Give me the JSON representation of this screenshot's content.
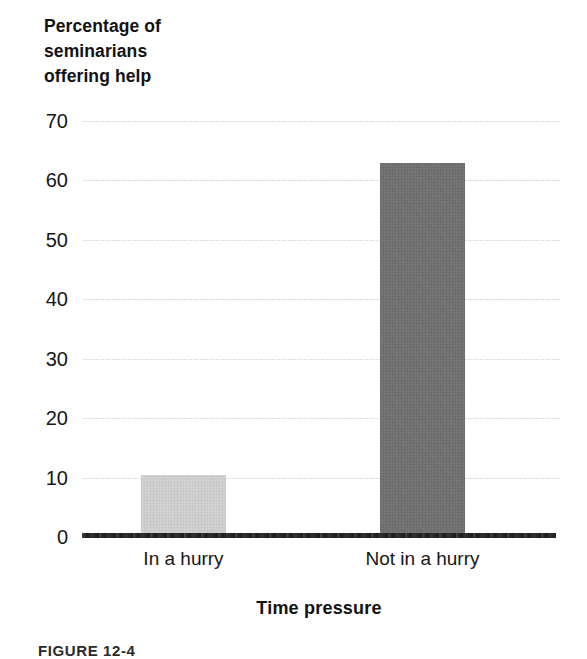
{
  "figure": {
    "caption": "FIGURE 12-4",
    "y_axis_title_lines": [
      "Percentage of",
      "seminarians",
      "offering help"
    ],
    "x_axis_title": "Time pressure"
  },
  "chart_data": {
    "type": "bar",
    "title": "",
    "subtitle": "",
    "xlabel": "Time pressure",
    "ylabel": "Percentage of seminarians offering help",
    "categories": [
      "In a hurry",
      "Not in a hurry"
    ],
    "values": [
      10.5,
      63
    ],
    "ylim": [
      0,
      70
    ],
    "yticks": [
      0,
      10,
      20,
      30,
      40,
      50,
      60,
      70
    ],
    "ytick_labels": [
      "0",
      "10",
      "20",
      "30",
      "40",
      "50",
      "60",
      "70"
    ],
    "grid": "horizontal",
    "legend": "none",
    "bar_colors": [
      "#d3d3d3",
      "#6e6e6e"
    ],
    "annotations": []
  },
  "colors": {
    "bar_light": "#d3d3d3",
    "bar_dark": "#6e6e6e",
    "gridline": "#dcdcdc",
    "baseline": "#1b1b1b",
    "text": "#161616"
  }
}
